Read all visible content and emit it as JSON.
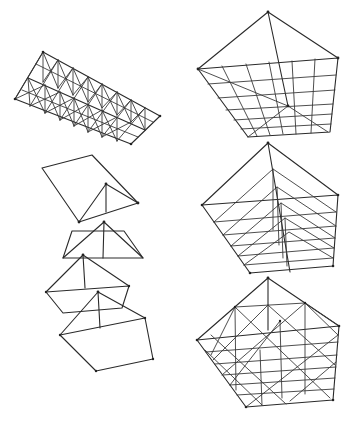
{
  "figure": {
    "stroke_color": "#2a2a2a",
    "background": "#ffffff",
    "panels": [
      {
        "id": "gable-space-frame",
        "label": ""
      },
      {
        "id": "exploded-pyramid-modules",
        "label": ""
      },
      {
        "id": "pyramid-top-grid",
        "label": ""
      },
      {
        "id": "pyramid-nested-ridges",
        "label": ""
      },
      {
        "id": "pyramid-full-lattice",
        "label": ""
      }
    ]
  }
}
